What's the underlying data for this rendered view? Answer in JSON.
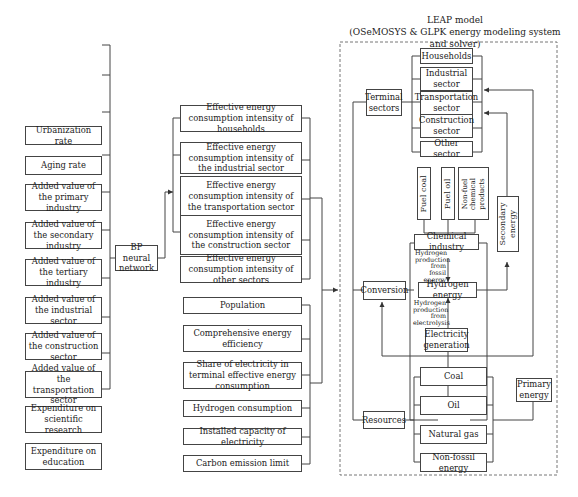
{
  "leap": {
    "title": "LEAP model",
    "subtitle": "(OSeMOSYS & GLPK energy modeling system and solver)"
  },
  "inputs": [
    "Urbanization rate",
    "Aging rate",
    "Added value of the primary industry",
    "Added value of the secondary industry",
    "Added value of the tertiary industry",
    "Added value of the industrial sector",
    "Added value of the construction sector",
    "Added value of the transportation sector",
    "Expenditure on scientific research",
    "Expenditure on education"
  ],
  "bp_network": "BP neural network",
  "intensities": [
    "Effective energy consumption intensity of households",
    "Effective energy consumption intensity of the industrial sector",
    "Effective energy consumption intensity of the transportation sector",
    "Effective energy consumption intensity of the construction sector",
    "Effective energy consumption intensity of other sectors"
  ],
  "parameters": [
    "Population",
    "Comprehensive energy efficiency",
    "Share of electricity in terminal effective energy consumption",
    "Hydrogen consumption",
    "Installed capacity of electricity",
    "Carbon emission limit"
  ],
  "terminal": {
    "label": "Terminal sectors",
    "sectors": [
      "Households",
      "Industrial sector",
      "Transportation sector",
      "Construction sector",
      "Other sector"
    ]
  },
  "products": [
    "Fuel coal",
    "Fuel oil",
    "Non-fuel chemical products"
  ],
  "secondary_energy": "Secondary energy",
  "conversion": {
    "label": "Conversion",
    "chemical_industry": "Chemical industry",
    "note_fossil": "Hydrogen production from fossil energy",
    "hydrogen_energy": "Hydrogen energy",
    "note_electrolysis": "Hydrogen production from electrolysis",
    "electricity_generation": "Electricity generation"
  },
  "resources": {
    "label": "Resources",
    "items": [
      "Coal",
      "Oil",
      "Natural gas",
      "Non-fossil energy"
    ]
  },
  "primary_energy": "Primary energy"
}
